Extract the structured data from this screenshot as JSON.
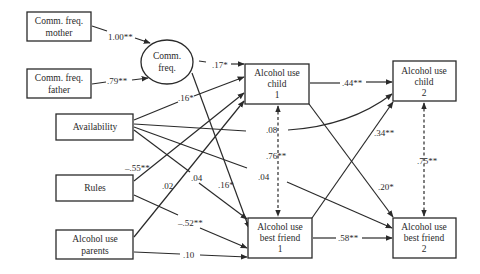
{
  "diagram": {
    "type": "path-model",
    "nodes": {
      "comm_mother": {
        "lines": [
          "Comm. freq.",
          "mother"
        ],
        "shape": "rect"
      },
      "comm_father": {
        "lines": [
          "Comm. freq.",
          "father"
        ],
        "shape": "rect"
      },
      "comm_latent": {
        "lines": [
          "Comm.",
          "freq."
        ],
        "shape": "ellipse"
      },
      "availability": {
        "lines": [
          "Availability"
        ],
        "shape": "rect"
      },
      "rules": {
        "lines": [
          "Rules"
        ],
        "shape": "rect"
      },
      "parents": {
        "lines": [
          "Alcohol use",
          "parents"
        ],
        "shape": "rect"
      },
      "child1": {
        "lines": [
          "Alcohol use",
          "child",
          "1"
        ],
        "shape": "rect"
      },
      "child2": {
        "lines": [
          "Alcohol use",
          "child",
          "2"
        ],
        "shape": "rect"
      },
      "friend1": {
        "lines": [
          "Alcohol use",
          "best friend",
          "1"
        ],
        "shape": "rect"
      },
      "friend2": {
        "lines": [
          "Alcohol use",
          "best friend",
          "2"
        ],
        "shape": "rect"
      }
    },
    "edges": [
      {
        "from": "comm_mother",
        "to": "comm_latent",
        "label": "1.00**",
        "style": "solid"
      },
      {
        "from": "comm_father",
        "to": "comm_latent",
        "label": ".79**",
        "style": "solid"
      },
      {
        "from": "comm_latent",
        "to": "child1",
        "label": ".17*",
        "style": "solid"
      },
      {
        "from": "comm_latent",
        "to": "friend1",
        "label": ".16*",
        "style": "solid"
      },
      {
        "from": "availability",
        "to": "child1",
        "label": ".16*",
        "style": "solid"
      },
      {
        "from": "availability",
        "to": "child2",
        "label": ".08",
        "style": "solid-curved"
      },
      {
        "from": "availability",
        "to": "friend1",
        "label": ".04",
        "style": "solid"
      },
      {
        "from": "availability",
        "to": "friend2",
        "label": ".04",
        "style": "solid"
      },
      {
        "from": "rules",
        "to": "child1",
        "label": "–.55**",
        "style": "solid"
      },
      {
        "from": "rules",
        "to": "friend1",
        "label": "–.52**",
        "style": "solid"
      },
      {
        "from": "parents",
        "to": "child1",
        "label": ".02",
        "style": "solid"
      },
      {
        "from": "parents",
        "to": "friend1",
        "label": ".10",
        "style": "solid"
      },
      {
        "from": "child1",
        "to": "child2",
        "label": ".44**",
        "style": "solid"
      },
      {
        "from": "child1",
        "to": "friend2",
        "label": ".20*",
        "style": "solid"
      },
      {
        "from": "friend1",
        "to": "child2",
        "label": ".34**",
        "style": "solid"
      },
      {
        "from": "friend1",
        "to": "friend2",
        "label": ".58**",
        "style": "solid"
      },
      {
        "from": "child1",
        "to": "friend1",
        "label": ".76**",
        "style": "dashed-bidirectional"
      },
      {
        "from": "child2",
        "to": "friend2",
        "label": ".75**",
        "style": "dashed-bidirectional"
      }
    ],
    "colors": {
      "stroke": "#2a2a2a",
      "background": "#ffffff"
    }
  }
}
